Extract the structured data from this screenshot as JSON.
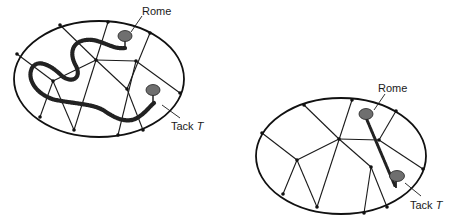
{
  "figures": [
    {
      "id": "left",
      "description": "Ellipse network with long winding rope path from Tack T to Rome",
      "labels": {
        "rome": "Rome",
        "tack_prefix": "Tack ",
        "tack_var": "T"
      }
    },
    {
      "id": "right",
      "description": "Ellipse network with short straight rope path from Rome to Tack T",
      "labels": {
        "rome": "Rome",
        "tack_prefix": "Tack ",
        "tack_var": "T"
      }
    }
  ],
  "colors": {
    "line": "#1a1a1a",
    "tack": "#6f6f6f",
    "background": "#ffffff"
  }
}
